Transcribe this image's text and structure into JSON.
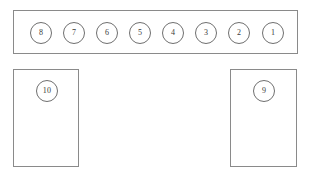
{
  "diagram": {
    "canvas": {
      "width": 316,
      "height": 188,
      "background": "#ffffff"
    },
    "stroke_color": "#8a8a8a",
    "label_color": "#3a3a3a"
  },
  "regions": [
    {
      "name": "top-bar",
      "shape": "rectangle",
      "x": 13,
      "y": 10,
      "width": 285,
      "height": 44
    },
    {
      "name": "left-block",
      "shape": "rectangle",
      "x": 13,
      "y": 69,
      "width": 66,
      "height": 98
    },
    {
      "name": "right-block",
      "shape": "rectangle",
      "x": 230,
      "y": 69,
      "width": 67,
      "height": 98
    }
  ],
  "seats": [
    {
      "label": "8",
      "cx": 41,
      "cy": 33,
      "r": 11,
      "region": "top-bar"
    },
    {
      "label": "7",
      "cx": 74,
      "cy": 33,
      "r": 11,
      "region": "top-bar"
    },
    {
      "label": "6",
      "cx": 107,
      "cy": 33,
      "r": 11,
      "region": "top-bar"
    },
    {
      "label": "5",
      "cx": 140,
      "cy": 33,
      "r": 11,
      "region": "top-bar"
    },
    {
      "label": "4",
      "cx": 173,
      "cy": 33,
      "r": 11,
      "region": "top-bar"
    },
    {
      "label": "3",
      "cx": 206,
      "cy": 33,
      "r": 11,
      "region": "top-bar"
    },
    {
      "label": "2",
      "cx": 239,
      "cy": 33,
      "r": 11,
      "region": "top-bar"
    },
    {
      "label": "1",
      "cx": 273,
      "cy": 33,
      "r": 11,
      "region": "top-bar"
    },
    {
      "label": "10",
      "cx": 47,
      "cy": 91,
      "r": 11,
      "region": "left-block"
    },
    {
      "label": "9",
      "cx": 264,
      "cy": 91,
      "r": 11,
      "region": "right-block"
    }
  ],
  "font": {
    "seat_label_size_px": 8
  }
}
